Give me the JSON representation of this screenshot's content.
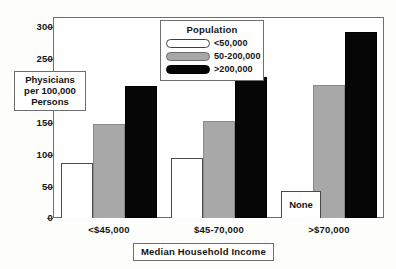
{
  "chart_data": {
    "type": "bar",
    "title": "",
    "xlabel": "Median Household Income",
    "ylabel_lines": [
      "Physicians",
      "per 100,000",
      "Persons"
    ],
    "categories": [
      "<$45,000",
      "$45-70,000",
      ">$70,000"
    ],
    "series": [
      {
        "name": "<50,000",
        "values": [
          86,
          93,
          null
        ],
        "color": "#ffffff",
        "null_label": "None"
      },
      {
        "name": "50-200,000",
        "values": [
          146,
          151,
          206
        ],
        "color": "#a8a8a8"
      },
      {
        "name": ">200,000",
        "values": [
          205,
          218,
          288
        ],
        "color": "#060606"
      }
    ],
    "ylim": [
      0,
      310
    ],
    "yticks": [
      0,
      50,
      100,
      150,
      200,
      250,
      300
    ],
    "ytick_labels": [
      "0",
      "50",
      "100",
      "150",
      "",
      "250",
      "300"
    ],
    "grid": false,
    "legend": {
      "title": "Population",
      "position": "top-center-inside"
    }
  },
  "legend": {
    "title": "Population",
    "entries": [
      {
        "label": "<50,000",
        "swatch": "swatch-white"
      },
      {
        "label": "50-200,000",
        "swatch": "swatch-gray"
      },
      {
        "label": ">200,000",
        "swatch": "swatch-black"
      }
    ]
  },
  "axes": {
    "y_title_lines": [
      "Physicians",
      "per 100,000",
      "Persons"
    ],
    "x_title": "Median Household Income",
    "y_tick_labels": [
      "300",
      "250",
      "150",
      "100",
      "50",
      "0"
    ],
    "x_tick_labels": [
      "<$45,000",
      "$45-70,000",
      ">$70,000"
    ]
  },
  "annotations": {
    "none_label": "None"
  }
}
